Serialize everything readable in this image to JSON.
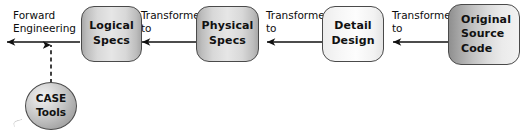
{
  "diagram": {
    "background_color": "#ffffff",
    "outline_color": "#4a4a4a",
    "text_color": "#111111",
    "nodes": [
      {
        "id": "case-tools",
        "shape": "ellipse",
        "lines": [
          "CASE",
          "Tools"
        ],
        "fill_style": "radial-gray"
      },
      {
        "id": "logical-specs",
        "shape": "rounded-rect",
        "lines": [
          "Logical",
          "Specs"
        ],
        "fill_style": "edge-shaded-gray"
      },
      {
        "id": "physical-specs",
        "shape": "rounded-rect",
        "lines": [
          "Physical",
          "Specs"
        ],
        "fill_style": "edge-shaded-gray"
      },
      {
        "id": "detail-design",
        "shape": "rounded-rect",
        "lines": [
          "Detail",
          "Design"
        ],
        "fill_style": "light-gray"
      },
      {
        "id": "original-source-code",
        "shape": "rounded-rect",
        "lines": [
          "Original",
          "Source",
          "Code"
        ],
        "fill_style": "left-dark-gradient"
      }
    ],
    "labels": [
      {
        "id": "forward-engineering",
        "lines": [
          "Forward",
          "Engineering"
        ]
      },
      {
        "id": "transformed-to-1",
        "lines": [
          "Transformed",
          "to"
        ]
      },
      {
        "id": "transformed-to-2",
        "lines": [
          "Transformed",
          "to"
        ]
      },
      {
        "id": "transformed-to-3",
        "lines": [
          "Transformed",
          "to"
        ]
      }
    ],
    "connectors": [
      {
        "id": "arrow-logical-to-output",
        "from": "logical-specs",
        "to": "output",
        "style": "solid",
        "arrowhead": "left"
      },
      {
        "id": "arrow-physical-to-logical",
        "from": "physical-specs",
        "to": "logical-specs",
        "style": "solid",
        "arrowhead": "left"
      },
      {
        "id": "arrow-detail-to-physical",
        "from": "detail-design",
        "to": "physical-specs",
        "style": "solid",
        "arrowhead": "left"
      },
      {
        "id": "arrow-source-to-detail",
        "from": "original-source-code",
        "to": "detail-design",
        "style": "solid",
        "arrowhead": "left"
      },
      {
        "id": "arrow-case-tools-up",
        "from": "case-tools",
        "to": "arrow-logical-to-output",
        "style": "dashed",
        "arrowhead": "up"
      }
    ]
  }
}
